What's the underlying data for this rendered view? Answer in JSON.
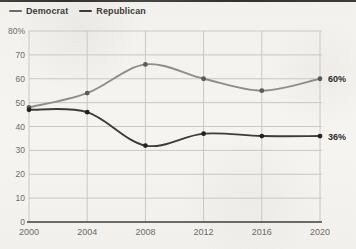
{
  "page": {
    "background_color": "#f3f2ef",
    "top_edge_color": "#2a2926"
  },
  "legend": {
    "position": "top-left",
    "items": [
      {
        "label": "Democrat",
        "swatch_color": "#6e6d6a"
      },
      {
        "label": "Republican",
        "swatch_color": "#3d3c3a"
      }
    ]
  },
  "chart_data": {
    "type": "line",
    "title": "",
    "xlabel": "",
    "ylabel": "",
    "x": [
      2000,
      2004,
      2008,
      2012,
      2016,
      2020
    ],
    "x_tick_labels": [
      "2000",
      "2004",
      "2008",
      "2012",
      "2016",
      "2020"
    ],
    "y_ticks": [
      80,
      70,
      60,
      50,
      40,
      30,
      20,
      10,
      0
    ],
    "y_tick_labels": [
      "80%",
      "70",
      "60",
      "50",
      "40",
      "30",
      "20",
      "10",
      "0"
    ],
    "ylim": [
      0,
      80
    ],
    "grid": true,
    "legend_position": "top-left",
    "grid_color": "#c9c8c4",
    "axis_line_color": "#45443f",
    "tick_label_color": "#6d6c68",
    "end_label_color": "#2c2b28",
    "series": [
      {
        "name": "Democrat",
        "color": "#8e8d89",
        "marker_color": "#5c5b57",
        "values": [
          48,
          54,
          66,
          60,
          55,
          60
        ],
        "end_label": "60%"
      },
      {
        "name": "Republican",
        "color": "#3d3c3a",
        "marker_color": "#232220",
        "values": [
          47,
          46,
          32,
          37,
          36,
          36
        ],
        "end_label": "36%"
      }
    ]
  }
}
